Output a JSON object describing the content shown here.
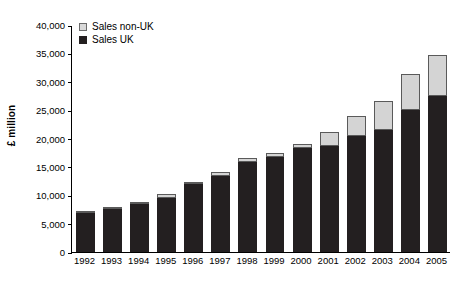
{
  "chart_data": {
    "type": "bar",
    "stacked": true,
    "title": "",
    "xlabel": "",
    "ylabel": "£ million",
    "ylim": [
      0,
      40000
    ],
    "ytick_step": 5000,
    "grid": false,
    "legend_position": "top-left",
    "categories": [
      "1992",
      "1993",
      "1994",
      "1995",
      "1996",
      "1997",
      "1998",
      "1999",
      "2000",
      "2001",
      "2002",
      "2003",
      "2004",
      "2005"
    ],
    "yticks": [
      "0",
      "5,000",
      "10,000",
      "15,000",
      "20,000",
      "25,000",
      "30,000",
      "35,000",
      "40,000"
    ],
    "series": [
      {
        "name": "Sales UK",
        "color": "#231f20",
        "values": [
          6900,
          7500,
          8500,
          9600,
          12000,
          13400,
          15900,
          16700,
          18300,
          18600,
          20500,
          21500,
          25000,
          27500
        ]
      },
      {
        "name": "Sales non-UK",
        "color": "#d4d4d4",
        "values": [
          200,
          200,
          300,
          600,
          400,
          700,
          700,
          700,
          800,
          2500,
          3400,
          5200,
          6400,
          7200
        ]
      }
    ],
    "totals": [
      7100,
      7700,
      8800,
      10200,
      12400,
      14100,
      16600,
      17400,
      19100,
      21100,
      23900,
      26700,
      31400,
      34700
    ]
  },
  "legend": {
    "items": [
      {
        "label": "Sales non-UK",
        "swatch": "nonuk"
      },
      {
        "label": "Sales UK",
        "swatch": "uk"
      }
    ]
  }
}
